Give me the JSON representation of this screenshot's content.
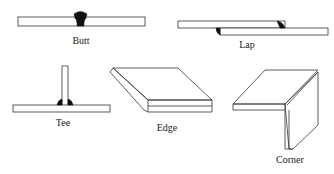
{
  "diagram": {
    "joints": [
      {
        "id": "butt",
        "label": "Butt"
      },
      {
        "id": "lap",
        "label": "Lap"
      },
      {
        "id": "tee",
        "label": "Tee"
      },
      {
        "id": "edge",
        "label": "Edge"
      },
      {
        "id": "corner",
        "label": "Corner"
      }
    ]
  }
}
